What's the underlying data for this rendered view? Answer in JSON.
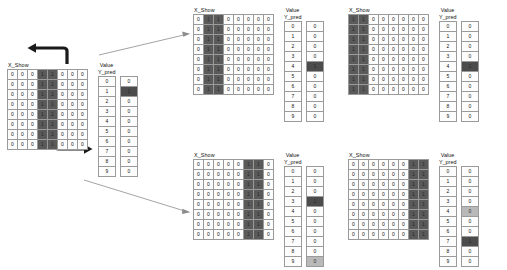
{
  "labels": {
    "x_show": "X_Show",
    "value": "Value",
    "y_pred": "Y_pred"
  },
  "colors": {
    "cell_on": "#5a5a5a",
    "cell_off": "#fdfdfd",
    "pred_hot": "#4c4c4c",
    "pred_warm": "#b9b9b9",
    "grid_line": "#9a9a9a",
    "arrow": "#1a1a1a",
    "connector": "#8c8c8c"
  },
  "value_index": [
    "0",
    "1",
    "2",
    "3",
    "4",
    "5",
    "6",
    "7",
    "8",
    "9"
  ],
  "groups": [
    {
      "id": "source",
      "role": "source-input",
      "label": "X_Show",
      "matrix": {
        "rows": 8,
        "cols": 8,
        "on_columns": [
          3,
          4
        ],
        "on_value": "1",
        "off_value": "0"
      },
      "value_label": "Value",
      "y_pred_label": "Y_pred",
      "y_pred": [
        {
          "index": "0",
          "value": "0",
          "state": "normal"
        },
        {
          "index": "1",
          "value": "1",
          "state": "hot"
        },
        {
          "index": "2",
          "value": "0",
          "state": "normal"
        },
        {
          "index": "3",
          "value": "0",
          "state": "normal"
        },
        {
          "index": "4",
          "value": "0",
          "state": "normal"
        },
        {
          "index": "5",
          "value": "0",
          "state": "normal"
        },
        {
          "index": "6",
          "value": "0",
          "state": "normal"
        },
        {
          "index": "7",
          "value": "0",
          "state": "normal"
        },
        {
          "index": "8",
          "value": "0",
          "state": "normal"
        },
        {
          "index": "9",
          "value": "0",
          "state": "normal"
        }
      ]
    },
    {
      "id": "shift-left-1",
      "role": "shifted-left-result",
      "label": "X_Show",
      "matrix": {
        "rows": 8,
        "cols": 8,
        "on_columns": [
          1,
          2
        ],
        "on_value": "1",
        "off_value": "0"
      },
      "value_label": "Value",
      "y_pred_label": "Y_pred",
      "y_pred": [
        {
          "index": "0",
          "value": "0",
          "state": "normal"
        },
        {
          "index": "1",
          "value": "0",
          "state": "normal"
        },
        {
          "index": "2",
          "value": "0",
          "state": "normal"
        },
        {
          "index": "3",
          "value": "0",
          "state": "normal"
        },
        {
          "index": "4",
          "value": "1",
          "state": "hot"
        },
        {
          "index": "5",
          "value": "0",
          "state": "normal"
        },
        {
          "index": "6",
          "value": "0",
          "state": "normal"
        },
        {
          "index": "7",
          "value": "0",
          "state": "normal"
        },
        {
          "index": "8",
          "value": "0",
          "state": "normal"
        },
        {
          "index": "9",
          "value": "0",
          "state": "normal"
        }
      ]
    },
    {
      "id": "shift-left-2",
      "role": "shifted-left-result",
      "label": "X_Show",
      "matrix": {
        "rows": 8,
        "cols": 8,
        "on_columns": [
          0,
          1
        ],
        "on_value": "1",
        "off_value": "0"
      },
      "value_label": "Value",
      "y_pred_label": "Y_pred",
      "y_pred": [
        {
          "index": "0",
          "value": "0",
          "state": "normal"
        },
        {
          "index": "1",
          "value": "0",
          "state": "normal"
        },
        {
          "index": "2",
          "value": "0",
          "state": "normal"
        },
        {
          "index": "3",
          "value": "0",
          "state": "normal"
        },
        {
          "index": "4",
          "value": "1",
          "state": "hot"
        },
        {
          "index": "5",
          "value": "0",
          "state": "normal"
        },
        {
          "index": "6",
          "value": "0",
          "state": "normal"
        },
        {
          "index": "7",
          "value": "0",
          "state": "normal"
        },
        {
          "index": "8",
          "value": "0",
          "state": "normal"
        },
        {
          "index": "9",
          "value": "0",
          "state": "normal"
        }
      ]
    },
    {
      "id": "shift-right-1",
      "role": "shifted-right-result",
      "label": "X_Show",
      "matrix": {
        "rows": 8,
        "cols": 8,
        "on_columns": [
          5,
          6
        ],
        "on_value": "1",
        "off_value": "0"
      },
      "value_label": "Value",
      "y_pred_label": "Y_pred",
      "y_pred": [
        {
          "index": "0",
          "value": "0",
          "state": "normal"
        },
        {
          "index": "1",
          "value": "0",
          "state": "normal"
        },
        {
          "index": "2",
          "value": "0",
          "state": "normal"
        },
        {
          "index": "3",
          "value": "1",
          "state": "hot"
        },
        {
          "index": "4",
          "value": "0",
          "state": "normal"
        },
        {
          "index": "5",
          "value": "0",
          "state": "normal"
        },
        {
          "index": "6",
          "value": "0",
          "state": "normal"
        },
        {
          "index": "7",
          "value": "0",
          "state": "normal"
        },
        {
          "index": "8",
          "value": "0",
          "state": "normal"
        },
        {
          "index": "9",
          "value": "0",
          "state": "warm"
        }
      ]
    },
    {
      "id": "shift-right-2",
      "role": "shifted-right-result",
      "label": "X_Show",
      "matrix": {
        "rows": 8,
        "cols": 8,
        "on_columns": [
          6,
          7
        ],
        "on_value": "1",
        "off_value": "0"
      },
      "value_label": "Value",
      "y_pred_label": "Y_pred",
      "y_pred": [
        {
          "index": "0",
          "value": "0",
          "state": "normal"
        },
        {
          "index": "1",
          "value": "0",
          "state": "normal"
        },
        {
          "index": "2",
          "value": "0",
          "state": "normal"
        },
        {
          "index": "3",
          "value": "0",
          "state": "normal"
        },
        {
          "index": "4",
          "value": "0",
          "state": "warm"
        },
        {
          "index": "5",
          "value": "0",
          "state": "normal"
        },
        {
          "index": "6",
          "value": "0",
          "state": "normal"
        },
        {
          "index": "7",
          "value": "1",
          "state": "hot"
        },
        {
          "index": "8",
          "value": "0",
          "state": "normal"
        },
        {
          "index": "9",
          "value": "0",
          "state": "normal"
        }
      ]
    }
  ],
  "connectors": [
    {
      "id": "shift-left-arrow",
      "kind": "curved-arrow-left",
      "meaning": "shift columns left"
    },
    {
      "id": "shift-right-arrow",
      "kind": "curved-arrow-right",
      "meaning": "shift columns right"
    },
    {
      "id": "link-to-top-row",
      "kind": "thin-line-arrow",
      "meaning": "leads to upper result group"
    },
    {
      "id": "link-to-bottom-row",
      "kind": "thin-line-arrow",
      "meaning": "leads to lower result group"
    }
  ]
}
